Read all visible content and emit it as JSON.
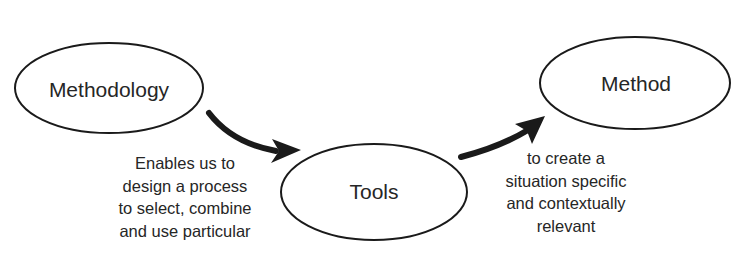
{
  "nodes": [
    {
      "id": "methodology",
      "label": "Methodology",
      "cx": 109,
      "cy": 88,
      "rx": 94,
      "ry": 45
    },
    {
      "id": "tools",
      "label": "Tools",
      "cx": 374,
      "cy": 192,
      "rx": 93,
      "ry": 48
    },
    {
      "id": "method",
      "label": "Method",
      "cx": 635,
      "cy": 83,
      "rx": 95,
      "ry": 46
    }
  ],
  "edges": [
    {
      "from": "methodology",
      "to": "tools",
      "caption": [
        "Enables us to",
        "design a process",
        "to select, combine",
        "and use particular"
      ]
    },
    {
      "from": "tools",
      "to": "method",
      "caption": [
        "to create a",
        "situation specific",
        "and contextually",
        "relevant"
      ]
    }
  ],
  "colors": {
    "stroke": "#1a1a1a",
    "arrow": "#1a1a1a",
    "text": "#262626",
    "background": "#ffffff"
  }
}
